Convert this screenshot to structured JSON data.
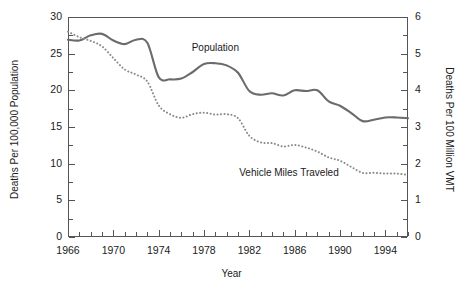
{
  "chart_data": {
    "type": "line",
    "title": "",
    "xlabel": "Year",
    "ylabel": "Deaths Per 100,000 Population",
    "ylabel_right": "Deaths Per 100 Million VMT",
    "xlim": [
      1966,
      1996
    ],
    "ylim": [
      0,
      30
    ],
    "ylim_right": [
      0,
      6
    ],
    "grid": false,
    "legend_position": "inline-annotations",
    "x_ticks": [
      1966,
      1970,
      1974,
      1978,
      1982,
      1986,
      1990,
      1994
    ],
    "x_minor_step": 1,
    "y_ticks_left": [
      0,
      5,
      10,
      15,
      20,
      25,
      30
    ],
    "y_minor_step_left": 2.5,
    "y_ticks_right": [
      0,
      1,
      2,
      3,
      4,
      5,
      6
    ],
    "y_minor_step_right": 0.5,
    "x": [
      1966,
      1967,
      1968,
      1969,
      1970,
      1971,
      1972,
      1973,
      1974,
      1975,
      1976,
      1977,
      1978,
      1979,
      1980,
      1981,
      1982,
      1983,
      1984,
      1985,
      1986,
      1987,
      1988,
      1989,
      1990,
      1991,
      1992,
      1993,
      1994,
      1995,
      1996
    ],
    "series": [
      {
        "name": "Population",
        "axis": "left",
        "style": "solid",
        "color": "#6b6b6b",
        "label": "Population",
        "units": "deaths per 100,000 population",
        "values": [
          26.9,
          26.8,
          27.5,
          27.7,
          26.8,
          26.3,
          26.9,
          26.5,
          21.8,
          21.5,
          21.6,
          22.5,
          23.6,
          23.7,
          23.4,
          22.4,
          19.9,
          19.4,
          19.6,
          19.3,
          20.0,
          19.9,
          20.0,
          18.5,
          17.9,
          16.9,
          15.8,
          16.0,
          16.3,
          16.3,
          16.2
        ]
      },
      {
        "name": "Vehicle Miles Traveled",
        "axis": "right",
        "style": "dotted",
        "color": "#8a8a8a",
        "label": "Vehicle Miles Traveled",
        "units": "deaths per 100 million VMT",
        "values": [
          5.6,
          5.45,
          5.35,
          5.2,
          4.88,
          4.57,
          4.43,
          4.24,
          3.59,
          3.35,
          3.25,
          3.35,
          3.39,
          3.34,
          3.35,
          3.24,
          2.76,
          2.58,
          2.56,
          2.47,
          2.51,
          2.44,
          2.33,
          2.17,
          2.08,
          1.91,
          1.75,
          1.75,
          1.73,
          1.73,
          1.69
        ]
      }
    ],
    "annotations": [
      {
        "text": "Population",
        "x": 1979,
        "y_left": 25.6
      },
      {
        "text": "Vehicle Miles Traveled",
        "x": 1985.5,
        "y_left": 8.6
      }
    ]
  },
  "axes": {
    "x_title": "Year",
    "y_left_title": "Deaths Per 100,000 Population",
    "y_right_title": "Deaths Per 100 Million VMT"
  }
}
